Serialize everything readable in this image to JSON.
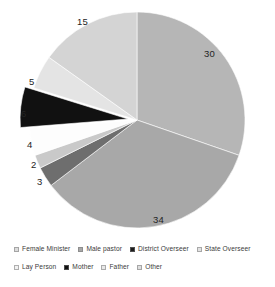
{
  "chart_data": {
    "type": "pie",
    "title": "",
    "subtitle": "",
    "xlabel": "",
    "ylabel": "",
    "grid": false,
    "legend_position": "bottom",
    "total": 99,
    "labels_show_values": true,
    "categories": [
      "Female Minister",
      "Male pastor",
      "District Overseer",
      "State Overseer",
      "Lay Person",
      "Mother",
      "Father",
      "Other"
    ],
    "values": [
      30,
      34,
      3,
      2,
      4,
      6,
      5,
      15
    ],
    "colors": [
      "#b6b6b6",
      "#a8a8a8",
      "#6e6e6e",
      "#c9c9c9",
      "#fdfdfd",
      "#111111",
      "#e4e4e4",
      "#d4d4d4"
    ],
    "exploded": [
      "Mother"
    ],
    "slices": [
      {
        "label": "Female Minister",
        "value": 30,
        "color": "#b6b6b6",
        "label_x": 204,
        "label_y": 49
      },
      {
        "label": "Male pastor",
        "value": 34,
        "color": "#a8a8a8",
        "label_x": 153,
        "label_y": 215
      },
      {
        "label": "District Overseer",
        "value": 3,
        "color": "#6e6e6e",
        "label_x": 37,
        "label_y": 177
      },
      {
        "label": "State Overseer",
        "value": 2,
        "color": "#c9c9c9",
        "label_x": 31,
        "label_y": 160
      },
      {
        "label": "Lay Person",
        "value": 4,
        "color": "#fdfdfd",
        "label_x": 27,
        "label_y": 140
      },
      {
        "label": "Mother",
        "value": 6,
        "color": "#111111",
        "label_x": 21,
        "label_y": 109
      },
      {
        "label": "Father",
        "value": 5,
        "color": "#e4e4e4",
        "label_x": 29,
        "label_y": 77
      },
      {
        "label": "Other",
        "value": 15,
        "color": "#d4d4d4",
        "label_x": 77,
        "label_y": 17
      }
    ]
  },
  "legend": {
    "rows": [
      [
        {
          "label": "Female Minister",
          "color": "#dcdcdc"
        },
        {
          "label": "Male pastor",
          "color": "#a8a8a8"
        },
        {
          "label": "District Overseer",
          "color": "#1c1c1c"
        },
        {
          "label": "State Overseer",
          "color": "#e2e2e2"
        }
      ],
      [
        {
          "label": "Lay Person",
          "color": "#f2f2f2"
        },
        {
          "label": "Mother",
          "color": "#111111"
        },
        {
          "label": "Father",
          "color": "#e8e8e8"
        },
        {
          "label": "Other",
          "color": "#dedede"
        }
      ]
    ]
  }
}
